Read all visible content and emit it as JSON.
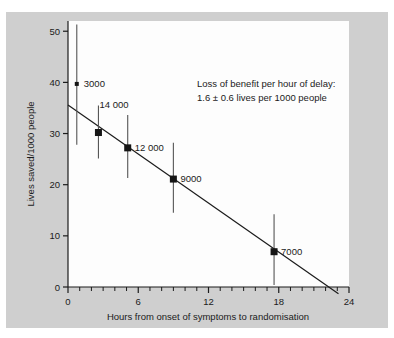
{
  "chart_data": {
    "type": "scatter",
    "title": "",
    "xlabel": "Hours from onset of symptoms to randomisation",
    "ylabel": "Lives saved/1000 people",
    "xlim": [
      0,
      24
    ],
    "ylim": [
      0,
      52
    ],
    "x_ticks": [
      0,
      6,
      12,
      18,
      24
    ],
    "x_tick_labels": [
      "0",
      "6",
      "12",
      "18",
      "24"
    ],
    "x_minor_tick_step": 1,
    "y_ticks": [
      0,
      10,
      20,
      30,
      40,
      50
    ],
    "y_tick_labels": [
      "0",
      "10",
      "20",
      "30",
      "40",
      "50"
    ],
    "grid": false,
    "legend": "none",
    "points": [
      {
        "label": "3000",
        "x": 0.75,
        "y": 39.7,
        "y_low": 27.8,
        "y_high": 51.3,
        "marker_size": "small",
        "label_dx": 7,
        "label_dy": 3
      },
      {
        "label": "14 000",
        "x": 2.6,
        "y": 30.2,
        "y_low": 25.1,
        "y_high": 35.5,
        "marker_size": "large",
        "label_dx": 1,
        "label_dy": -25
      },
      {
        "label": "12 000",
        "x": 5.1,
        "y": 27.2,
        "y_low": 21.3,
        "y_high": 33.6,
        "marker_size": "large",
        "label_dx": 7,
        "label_dy": 3
      },
      {
        "label": "9000",
        "x": 9.0,
        "y": 21.1,
        "y_low": 14.5,
        "y_high": 28.2,
        "marker_size": "large",
        "label_dx": 7,
        "label_dy": 3
      },
      {
        "label": "7000",
        "x": 17.6,
        "y": 6.9,
        "y_low": 0.4,
        "y_high": 14.2,
        "marker_size": "large",
        "label_dx": 7,
        "label_dy": 3
      }
    ],
    "fit_line": {
      "x_start": 0.0,
      "y_start": 35.6,
      "x_end": 23.1,
      "y_end": -1.3,
      "slope_per_hour": -1.6
    },
    "annotation": {
      "line1": "Loss of benefit per hour of delay:",
      "line2": "1.6 ± 0.6 lives per 1000 people"
    },
    "colors": {
      "panel_background": "#cfcfcf",
      "plot_background": "#fdfdfd",
      "axis": "#1b1b1b",
      "marker": "#151515",
      "error_bar": "#555555",
      "fit_line": "#1b1b1b",
      "text": "#1b1b1b"
    }
  }
}
